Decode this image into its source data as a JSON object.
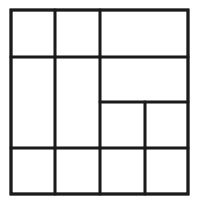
{
  "diagram": {
    "type": "rectangle-partition-grid",
    "stroke_color": "#1a1a1a",
    "background": "#ffffff",
    "stroke_width": 2.6,
    "outer": {
      "x1": 11,
      "y1": 10,
      "x2": 188,
      "y2": 194
    },
    "cells": [
      {
        "id": "r1c1",
        "x1": 11,
        "y1": 10,
        "x2": 55,
        "y2": 57
      },
      {
        "id": "r1c2",
        "x1": 55,
        "y1": 10,
        "x2": 100,
        "y2": 57
      },
      {
        "id": "r1c34",
        "x1": 100,
        "y1": 10,
        "x2": 188,
        "y2": 57
      },
      {
        "id": "r23c1",
        "x1": 11,
        "y1": 57,
        "x2": 55,
        "y2": 148
      },
      {
        "id": "r23c2",
        "x1": 55,
        "y1": 57,
        "x2": 100,
        "y2": 148
      },
      {
        "id": "r2c34",
        "x1": 100,
        "y1": 57,
        "x2": 188,
        "y2": 102
      },
      {
        "id": "r3c3",
        "x1": 100,
        "y1": 102,
        "x2": 145,
        "y2": 148
      },
      {
        "id": "r3c4",
        "x1": 145,
        "y1": 102,
        "x2": 188,
        "y2": 148
      },
      {
        "id": "r4c1",
        "x1": 11,
        "y1": 148,
        "x2": 55,
        "y2": 194
      },
      {
        "id": "r4c2",
        "x1": 55,
        "y1": 148,
        "x2": 100,
        "y2": 194
      },
      {
        "id": "r4c3",
        "x1": 100,
        "y1": 148,
        "x2": 145,
        "y2": 194
      },
      {
        "id": "r4c4",
        "x1": 145,
        "y1": 148,
        "x2": 188,
        "y2": 194
      }
    ]
  }
}
